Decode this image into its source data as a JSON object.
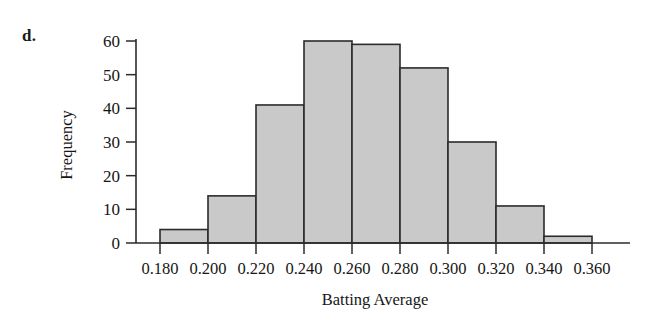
{
  "figure": {
    "part_label": "d."
  },
  "chart_data": {
    "type": "bar",
    "title": "",
    "subtitle": "",
    "xlabel": "Batting Average",
    "ylabel": "Frequency",
    "bin_width": 0.02,
    "bin_edges": [
      0.18,
      0.2,
      0.22,
      0.24,
      0.26,
      0.28,
      0.3,
      0.32,
      0.34,
      0.36
    ],
    "categories": [
      "0.180-0.200",
      "0.200-0.220",
      "0.220-0.240",
      "0.240-0.260",
      "0.260-0.280",
      "0.280-0.300",
      "0.300-0.320",
      "0.320-0.340",
      "0.340-0.360"
    ],
    "values": [
      4,
      14,
      41,
      60,
      59,
      52,
      30,
      11,
      2
    ],
    "x_tick_labels": [
      "0.180",
      "0.200",
      "0.220",
      "0.240",
      "0.260",
      "0.280",
      "0.300",
      "0.320",
      "0.340",
      "0.360"
    ],
    "x_tick_values": [
      0.18,
      0.2,
      0.22,
      0.24,
      0.26,
      0.28,
      0.3,
      0.32,
      0.34,
      0.36
    ],
    "y_tick_labels": [
      "0",
      "10",
      "20",
      "30",
      "40",
      "50",
      "60"
    ],
    "y_tick_values": [
      0,
      10,
      20,
      30,
      40,
      50,
      60
    ],
    "xlim": [
      0.18,
      0.36
    ],
    "ylim": [
      0,
      60
    ],
    "grid": false,
    "legend": "none",
    "bar_fill_color": "#c9c9c9",
    "bar_edge_color": "#2b2b2b",
    "axis_color": "#2b2b2b",
    "total_count": 273
  }
}
